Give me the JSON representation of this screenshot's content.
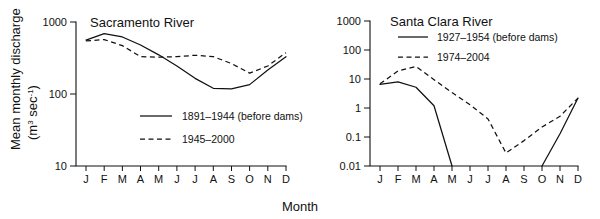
{
  "figure": {
    "xlabel": "Month",
    "ylabel_line1": "Mean monthly discharge",
    "ylabel_line2_pre": "(m",
    "ylabel_line2_sup": "3",
    "ylabel_line2_mid": " sec",
    "ylabel_line2_sup2": "-1",
    "ylabel_line2_post": ")"
  },
  "chart_data": [
    {
      "type": "line",
      "title": "Sacramento River",
      "xlabel": "Month",
      "ylabel": "Mean monthly discharge (m3 sec-1)",
      "yscale": "log",
      "ylim": [
        10,
        1000
      ],
      "yticks": [
        10,
        100,
        1000
      ],
      "yticklabels": [
        "10",
        "100",
        "1000"
      ],
      "categories": [
        "J",
        "F",
        "M",
        "A",
        "M",
        "J",
        "J",
        "A",
        "S",
        "O",
        "N",
        "D"
      ],
      "grid": false,
      "legend_position": "inside-center",
      "series": [
        {
          "name": "1891-1944 (before dams)",
          "style": "solid",
          "values": [
            560,
            690,
            620,
            480,
            350,
            245,
            165,
            120,
            118,
            135,
            215,
            330
          ]
        },
        {
          "name": "1945-2000",
          "style": "dashed",
          "values": [
            545,
            570,
            470,
            330,
            325,
            330,
            345,
            330,
            265,
            195,
            245,
            375
          ]
        }
      ]
    },
    {
      "type": "line",
      "title": "Santa Clara River",
      "xlabel": "Month",
      "ylabel": "Mean monthly discharge (m3 sec-1)",
      "yscale": "log",
      "ylim": [
        0.01,
        1000
      ],
      "yticks": [
        0.01,
        0.1,
        1,
        10,
        100,
        1000
      ],
      "yticklabels": [
        "0.01",
        "0.1",
        "1",
        "10",
        "100",
        "1000"
      ],
      "categories": [
        "J",
        "F",
        "M",
        "A",
        "M",
        "J",
        "J",
        "A",
        "S",
        "O",
        "N",
        "D"
      ],
      "grid": false,
      "legend_position": "inside-top",
      "series": [
        {
          "name": "1927-1954 (before dams)",
          "style": "solid",
          "values": [
            6.5,
            8.0,
            5.2,
            1.2,
            0.01,
            null,
            null,
            null,
            null,
            0.01,
            0.13,
            2.2
          ]
        },
        {
          "name": "1974-2004",
          "style": "dashed",
          "values": [
            6.8,
            19.0,
            27.0,
            9.5,
            3.4,
            1.3,
            0.42,
            0.028,
            0.075,
            0.22,
            0.52,
            2.2
          ]
        }
      ]
    }
  ],
  "left_panel": {
    "title": "Sacramento River",
    "yticklabels": [
      "1000",
      "100",
      "10"
    ],
    "monthlabels": [
      "J",
      "F",
      "M",
      "A",
      "M",
      "J",
      "J",
      "A",
      "S",
      "O",
      "N",
      "D"
    ],
    "legend": [
      {
        "label": "1891–1944 (before dams)",
        "style": "solid"
      },
      {
        "label": "1945–2000",
        "style": "dashed"
      }
    ]
  },
  "right_panel": {
    "title": "Santa Clara River",
    "yticklabels": [
      "1000",
      "100",
      "10",
      "1",
      "0.1",
      "0.01"
    ],
    "monthlabels": [
      "J",
      "F",
      "M",
      "A",
      "M",
      "J",
      "J",
      "A",
      "S",
      "O",
      "N",
      "D"
    ],
    "legend": [
      {
        "label": "1927–1954 (before dams)",
        "style": "solid"
      },
      {
        "label": "1974–2004",
        "style": "dashed"
      }
    ]
  }
}
